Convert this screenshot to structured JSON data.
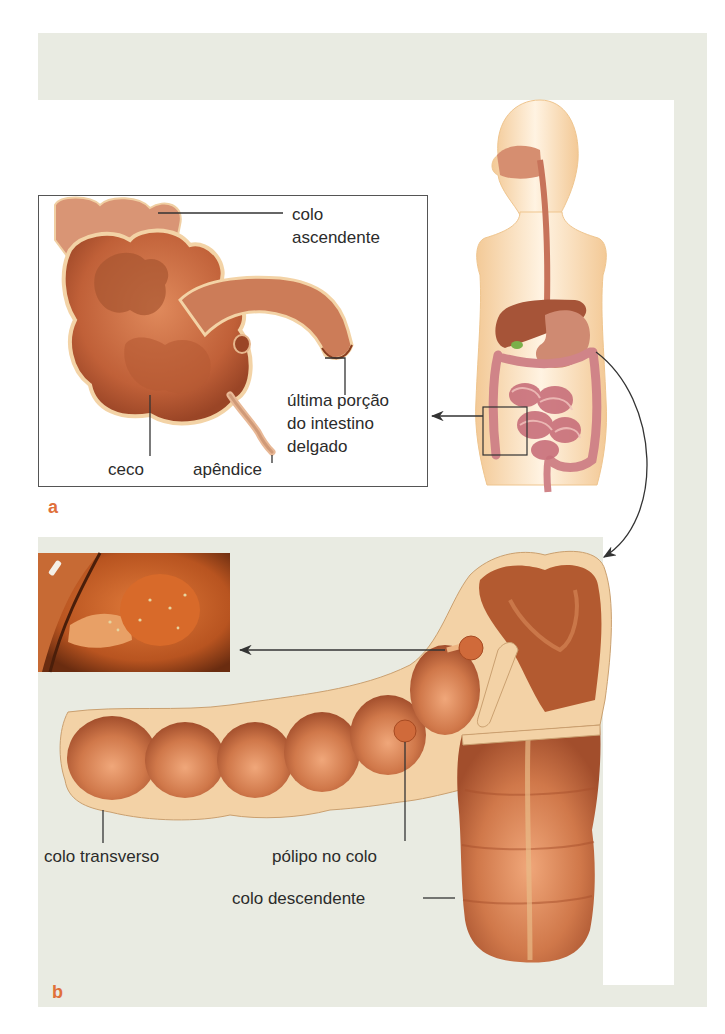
{
  "figure": {
    "panel_a": {
      "letter": "a",
      "labels": {
        "colo_ascendente_1": "colo",
        "colo_ascendente_2": "ascendente",
        "ultima_porcao_1": "última porção",
        "ultima_porcao_2": "do intestino",
        "ultima_porcao_3": "delgado",
        "ceco": "ceco",
        "apendice": "apêndice"
      }
    },
    "panel_b": {
      "letter": "b",
      "labels": {
        "colo_transverso": "colo transverso",
        "polipo": "pólipo no colo",
        "colo_descendente": "colo descendente"
      }
    },
    "colors": {
      "background_band": "#e9ebe2",
      "panel_letter": "#e0703a",
      "tissue": "#c8693f",
      "tissue_dark": "#9e4a2a",
      "tissue_wall": "#f0c79a",
      "skin": "#f6d7ac",
      "leader_line": "#333333"
    }
  }
}
